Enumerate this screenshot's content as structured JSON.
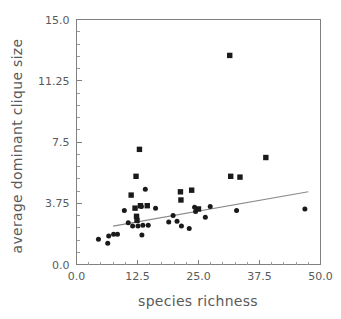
{
  "figure": {
    "background_color": "#ffffff",
    "marker_color": "#1a1a1a",
    "axis_color": "#808080",
    "trendline_color": "#8a8a8a",
    "caption_fragment": ""
  },
  "chart_data": {
    "type": "scatter",
    "title": "",
    "xlabel": "species richness",
    "ylabel": "average dominant clique size",
    "xlim": [
      0.0,
      50.0
    ],
    "ylim": [
      0.0,
      15.0
    ],
    "grid": false,
    "legend": null,
    "xticks": [
      0.0,
      12.5,
      25.0,
      37.5,
      50.0
    ],
    "xtick_labels": [
      "0.0",
      "12.5",
      "25.0",
      "37.5",
      "50.0"
    ],
    "yticks": [
      0.0,
      3.75,
      7.5,
      11.25,
      15.0
    ],
    "ytick_labels": [
      "0.0",
      "3.75",
      "7.5",
      "11.25",
      "15.0"
    ],
    "x_minor_tick_count": 4,
    "y_minor_tick_count": 4,
    "marker_shapes": [
      "circle",
      "square"
    ],
    "points": [
      {
        "x": 4.5,
        "y": 1.55,
        "shape": "circle"
      },
      {
        "x": 6.4,
        "y": 1.3,
        "shape": "circle"
      },
      {
        "x": 6.6,
        "y": 1.75,
        "shape": "circle"
      },
      {
        "x": 7.6,
        "y": 1.85,
        "shape": "circle"
      },
      {
        "x": 8.4,
        "y": 1.85,
        "shape": "circle"
      },
      {
        "x": 9.8,
        "y": 3.3,
        "shape": "circle"
      },
      {
        "x": 10.6,
        "y": 2.55,
        "shape": "circle"
      },
      {
        "x": 11.2,
        "y": 4.25,
        "shape": "square"
      },
      {
        "x": 11.5,
        "y": 2.35,
        "shape": "circle"
      },
      {
        "x": 12.0,
        "y": 3.45,
        "shape": "square"
      },
      {
        "x": 12.2,
        "y": 5.4,
        "shape": "square"
      },
      {
        "x": 12.3,
        "y": 2.95,
        "shape": "square"
      },
      {
        "x": 12.4,
        "y": 2.7,
        "shape": "square"
      },
      {
        "x": 12.6,
        "y": 2.35,
        "shape": "circle"
      },
      {
        "x": 12.9,
        "y": 7.05,
        "shape": "square"
      },
      {
        "x": 13.1,
        "y": 3.6,
        "shape": "square"
      },
      {
        "x": 13.3,
        "y": 3.55,
        "shape": "circle"
      },
      {
        "x": 13.4,
        "y": 1.8,
        "shape": "circle"
      },
      {
        "x": 13.6,
        "y": 2.4,
        "shape": "circle"
      },
      {
        "x": 14.1,
        "y": 4.6,
        "shape": "circle"
      },
      {
        "x": 14.5,
        "y": 3.6,
        "shape": "square"
      },
      {
        "x": 14.7,
        "y": 2.4,
        "shape": "circle"
      },
      {
        "x": 16.2,
        "y": 3.45,
        "shape": "circle"
      },
      {
        "x": 18.9,
        "y": 2.6,
        "shape": "circle"
      },
      {
        "x": 19.8,
        "y": 3.0,
        "shape": "circle"
      },
      {
        "x": 20.6,
        "y": 2.65,
        "shape": "circle"
      },
      {
        "x": 21.3,
        "y": 4.45,
        "shape": "square"
      },
      {
        "x": 21.4,
        "y": 3.95,
        "shape": "square"
      },
      {
        "x": 21.5,
        "y": 2.35,
        "shape": "circle"
      },
      {
        "x": 23.1,
        "y": 2.2,
        "shape": "circle"
      },
      {
        "x": 23.6,
        "y": 4.55,
        "shape": "square"
      },
      {
        "x": 24.2,
        "y": 3.5,
        "shape": "circle"
      },
      {
        "x": 24.4,
        "y": 3.25,
        "shape": "circle"
      },
      {
        "x": 25.0,
        "y": 3.4,
        "shape": "square"
      },
      {
        "x": 26.4,
        "y": 2.9,
        "shape": "circle"
      },
      {
        "x": 27.4,
        "y": 3.55,
        "shape": "circle"
      },
      {
        "x": 31.4,
        "y": 12.8,
        "shape": "square"
      },
      {
        "x": 31.6,
        "y": 5.4,
        "shape": "square"
      },
      {
        "x": 32.8,
        "y": 3.3,
        "shape": "circle"
      },
      {
        "x": 33.5,
        "y": 5.35,
        "shape": "square"
      },
      {
        "x": 38.8,
        "y": 6.55,
        "shape": "square"
      },
      {
        "x": 46.8,
        "y": 3.4,
        "shape": "circle"
      }
    ],
    "trendline": {
      "x0": 7.5,
      "y0": 2.35,
      "x1": 47.5,
      "y1": 4.45
    }
  }
}
